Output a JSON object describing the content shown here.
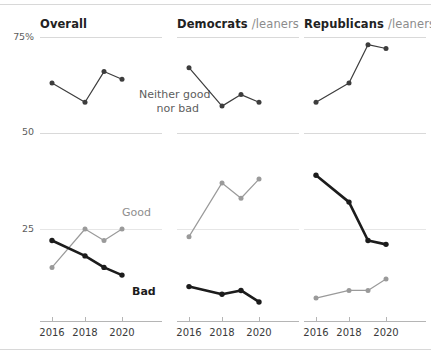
{
  "chart_data": {
    "type": "line",
    "title": "",
    "xlabel": "",
    "ylabel": "",
    "ylim": [
      15,
      80
    ],
    "yticks": [
      25,
      50,
      75
    ],
    "ytick_labels": [
      "25",
      "50",
      "75%"
    ],
    "x": [
      2016,
      2018,
      2019,
      2020
    ],
    "xtick_positions": [
      2016,
      2018,
      2020
    ],
    "xtick_labels": [
      "2016",
      "2018",
      "2020"
    ],
    "grid": "horizontal",
    "legend_position": "inline-annotations",
    "panels": [
      {
        "name": "Overall",
        "title": "Overall",
        "title_sub": "",
        "series": [
          {
            "name": "Neither good nor bad",
            "color": "#3d3d3d",
            "values": [
              63,
              58,
              66,
              64
            ]
          },
          {
            "name": "Good",
            "color": "#9a9a9a",
            "values": [
              15,
              25,
              22,
              25
            ]
          },
          {
            "name": "Bad",
            "color": "#1c1c1c",
            "values": [
              22,
              18,
              15,
              13
            ]
          }
        ]
      },
      {
        "name": "Democrats",
        "title": "Democrats",
        "title_sub": "/leaners",
        "series": [
          {
            "name": "Neither good nor bad",
            "color": "#3d3d3d",
            "values": [
              67,
              57,
              60,
              58
            ]
          },
          {
            "name": "Good",
            "color": "#9a9a9a",
            "values": [
              23,
              37,
              33,
              38
            ]
          },
          {
            "name": "Bad",
            "color": "#1c1c1c",
            "values": [
              10,
              8,
              9,
              6
            ]
          }
        ]
      },
      {
        "name": "Republicans",
        "title": "Republicans",
        "title_sub": "/leaners",
        "series": [
          {
            "name": "Neither good nor bad",
            "color": "#3d3d3d",
            "values": [
              58,
              63,
              73,
              72
            ]
          },
          {
            "name": "Good",
            "color": "#9a9a9a",
            "values": [
              7,
              9,
              9,
              12
            ]
          },
          {
            "name": "Bad",
            "color": "#1c1c1c",
            "values": [
              39,
              32,
              22,
              21
            ]
          }
        ]
      }
    ],
    "annotations": [
      {
        "name": "neither-label",
        "text": "Neither good\nnor bad",
        "line1": "Neither good",
        "line2": "nor bad",
        "color": "#5d5d5d"
      },
      {
        "name": "good-label",
        "text": "Good",
        "color": "#8e8e8e"
      },
      {
        "name": "bad-label",
        "text": "Bad",
        "color": "#1c1c1c"
      }
    ]
  },
  "axis": {
    "y_label_75": "75%",
    "y_label_50": "50",
    "y_label_25": "25",
    "x_label_2016": "2016",
    "x_label_2018": "2018",
    "x_label_2020": "2020"
  },
  "annotations": {
    "neither_line1": "Neither good",
    "neither_line2": "nor bad",
    "good": "Good",
    "bad": "Bad"
  },
  "panel_titles": {
    "overall": "Overall",
    "overall_sub": "",
    "democrats": "Democrats",
    "democrats_sub": "/leaners",
    "republicans": "Republicans",
    "republicans_sub": "/leaners"
  }
}
